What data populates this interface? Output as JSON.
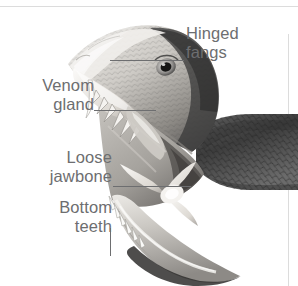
{
  "figure": {
    "background_color": "#ffffff",
    "rule_color": "#dcdcdc",
    "label_color": "#6d6e70",
    "leader_color": "#6d6e70"
  },
  "callouts": [
    {
      "id": "hinged-fangs",
      "text": "Hinged\nfangs",
      "side": "right",
      "leader": "horizontal"
    },
    {
      "id": "venom-gland",
      "text": "Venom\ngland",
      "side": "left",
      "leader": "horizontal"
    },
    {
      "id": "loose-jawbone",
      "text": "Loose\njawbone",
      "side": "left",
      "leader": "horizontal"
    },
    {
      "id": "bottom-teeth",
      "text": "Bottom\nteeth",
      "side": "left",
      "leader": "vertical"
    }
  ],
  "artwork": {
    "palette": {
      "scale_dark": "#4a4a4a",
      "scale_mid": "#7d7d7d",
      "flesh_light": "#dcdad6",
      "flesh_mid": "#b5b2ad",
      "bone_white": "#f2f1ee",
      "shadow": "#2e2e2e"
    }
  }
}
